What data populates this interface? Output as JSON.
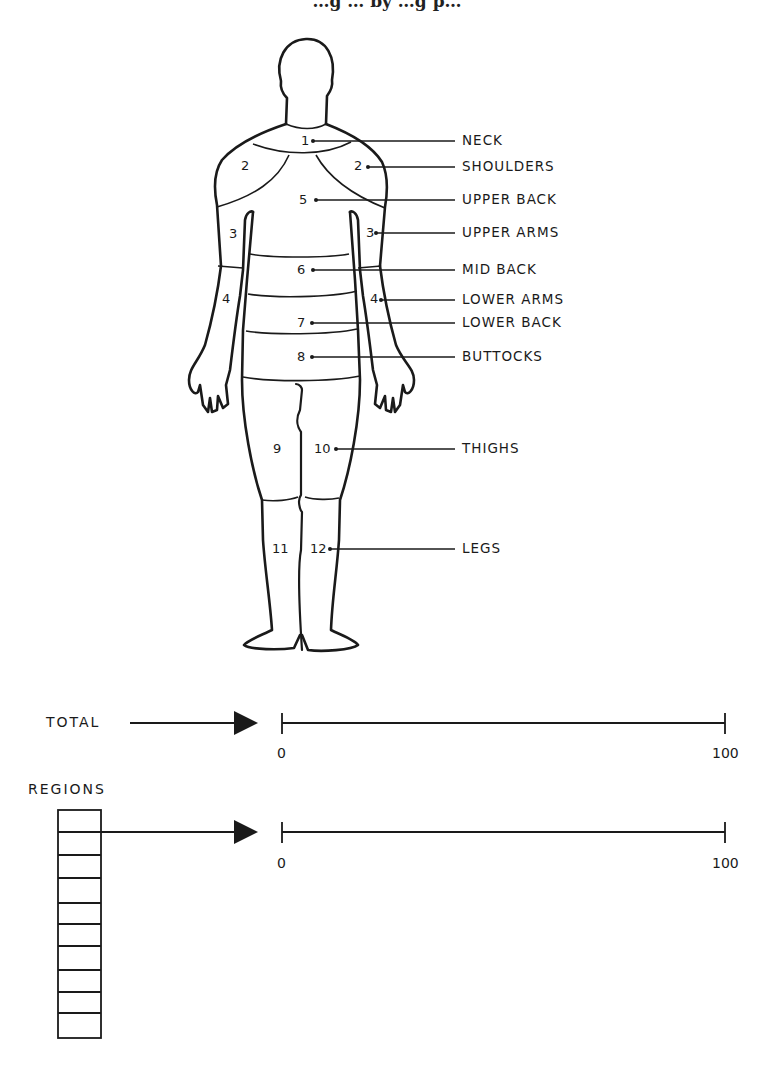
{
  "title": "…g … by …g p…",
  "regions": [
    {
      "number": "1",
      "label": "NECK"
    },
    {
      "number": "2",
      "label": "SHOULDERS"
    },
    {
      "number": "5",
      "label": "UPPER BACK"
    },
    {
      "number": "3",
      "label": "UPPER ARMS"
    },
    {
      "number": "6",
      "label": "MID BACK"
    },
    {
      "number": "4",
      "label": "LOWER ARMS"
    },
    {
      "number": "7",
      "label": "LOWER BACK"
    },
    {
      "number": "8",
      "label": "BUTTOCKS"
    },
    {
      "number": "10",
      "label": "THIGHS"
    },
    {
      "number": "12",
      "label": "LEGS"
    }
  ],
  "body_numbers": {
    "n1": "1",
    "n2l": "2",
    "n2r": "2",
    "n3l": "3",
    "n3r": "3",
    "n4l": "4",
    "n4r": "4",
    "n5": "5",
    "n6": "6",
    "n7": "7",
    "n8": "8",
    "n9": "9",
    "n10": "10",
    "n11": "11",
    "n12": "12"
  },
  "scales": {
    "total": {
      "label": "TOTAL",
      "min": "0",
      "max": "100"
    },
    "regions": {
      "label": "REGIONS",
      "min": "0",
      "max": "100",
      "cells": 10
    }
  }
}
